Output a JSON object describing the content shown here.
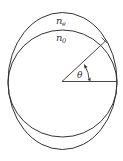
{
  "diagram": {
    "labels": {
      "ne_base": "n",
      "ne_sub": "e",
      "no_base": "n",
      "no_sub": "0",
      "theta": "θ"
    },
    "shapes": {
      "outer_ellipse": {
        "cx": 62.5,
        "cy": 81,
        "rx": 54.5,
        "ry": 68.5
      },
      "inner_circle": {
        "cx": 62.5,
        "cy": 83.5,
        "rx": 54.5,
        "ry": 53.5
      }
    },
    "colors": {
      "stroke": "#333333",
      "background": "#ffffff"
    }
  }
}
